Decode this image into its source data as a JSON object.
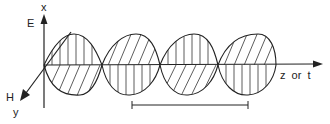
{
  "diagram": {
    "type": "electromagnetic-wave",
    "labels": {
      "x_axis": "x",
      "e_field": "E",
      "h_field": "H",
      "y_axis": "y",
      "propagation_axis": "z  or  t"
    },
    "wavelength_marker": {
      "description": "one wavelength span bar"
    },
    "colors": {
      "line": "#222222",
      "background": "#ffffff"
    }
  }
}
